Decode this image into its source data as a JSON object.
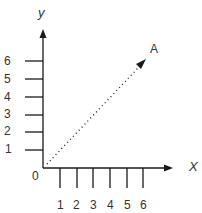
{
  "diagram": {
    "title": "",
    "x_axis": {
      "name": "X",
      "ticks": [
        "1",
        "2",
        "3",
        "4",
        "5",
        "6"
      ]
    },
    "y_axis": {
      "name": "y",
      "ticks": [
        "1",
        "2",
        "3",
        "4",
        "5",
        "6"
      ]
    },
    "origin_label": "0",
    "vector": {
      "label": "A",
      "style": "dotted",
      "from": [
        0,
        0
      ],
      "direction": "up-right"
    },
    "colors": {
      "line": "#1a1a1a",
      "text": "#333333",
      "background": "#ffffff"
    }
  }
}
